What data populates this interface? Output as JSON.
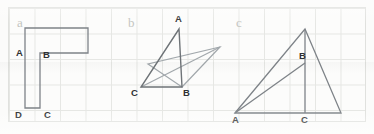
{
  "figure": {
    "background_color": "#fcfcfb",
    "grid_color": "#e6e7e4",
    "stroke_dark": "#6e7377",
    "stroke_light": "#9aa0a4",
    "label_color": "#2f3032",
    "panel_letter_color": "#c3c5c1",
    "panels": [
      {
        "id": "a",
        "letter": "a",
        "shape_type": "L-shaped polygon (rotated L / rectilinear hexagon)",
        "vertex_labels": [
          "A",
          "B",
          "C",
          "D"
        ],
        "labels": {
          "A": "A",
          "B": "B",
          "C": "C",
          "D": "D"
        },
        "polygon_points": "25,28 88,28 88,53 40,53 40,108 25,108",
        "stroke": "#7e8388"
      },
      {
        "id": "b",
        "letter": "b",
        "shape_type": "two overlapping triangles with common base vertex B",
        "vertex_labels": [
          "A",
          "B",
          "C"
        ],
        "labels": {
          "A": "A",
          "B": "B",
          "C": "C"
        },
        "dark_triangle_points": "179,29 182,87 141,87",
        "light_triangle_points": "182,87 220,47 148,64",
        "extra_segment": "141,87 220,47",
        "stroke_dark": "#6e7377",
        "stroke_light": "#a2a8ac"
      },
      {
        "id": "c",
        "letter": "c",
        "shape_type": "right triangle with internal cevian A-B and altitude to C",
        "vertex_labels": [
          "A",
          "B",
          "C"
        ],
        "labels": {
          "A": "A",
          "B": "B",
          "C": "C"
        },
        "outer_triangle_points": "235,113 305,29 341,113",
        "altitude_segment": "305,29 305,113",
        "cevian_segment": "235,113 305,63",
        "stroke": "#7e8388"
      }
    ]
  }
}
